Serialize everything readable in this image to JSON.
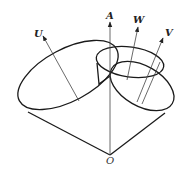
{
  "diagram": {
    "type": "cone-geometry",
    "labels": {
      "origin": "O",
      "axis_a": "A",
      "axis_u": "U",
      "axis_v": "V",
      "axis_w": "W"
    },
    "colors": {
      "stroke": "#1a1a1a",
      "background": "#ffffff"
    }
  }
}
